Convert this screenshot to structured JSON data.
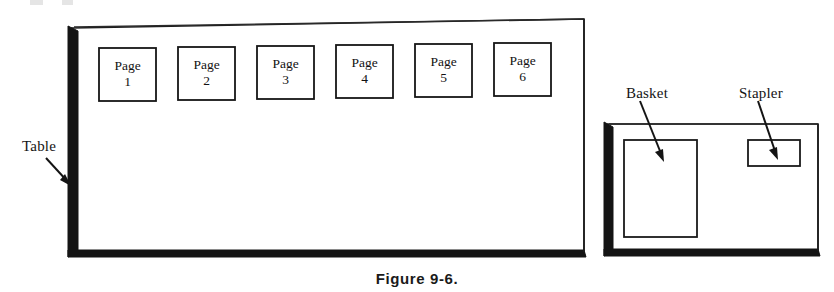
{
  "figure": {
    "caption": "Figure 9-6.",
    "domain_type": "line-art technical illustration"
  },
  "colors": {
    "ink": "#141414",
    "background": "#ffffff",
    "shadow": "#1a1a1a"
  },
  "main_table": {
    "label": "Table",
    "pages": [
      {
        "name": "Page",
        "number": "1"
      },
      {
        "name": "Page",
        "number": "2"
      },
      {
        "name": "Page",
        "number": "3"
      },
      {
        "name": "Page",
        "number": "4"
      },
      {
        "name": "Page",
        "number": "5"
      },
      {
        "name": "Page",
        "number": "6"
      }
    ]
  },
  "side_table": {
    "items": [
      {
        "label": "Basket"
      },
      {
        "label": "Stapler"
      }
    ]
  }
}
